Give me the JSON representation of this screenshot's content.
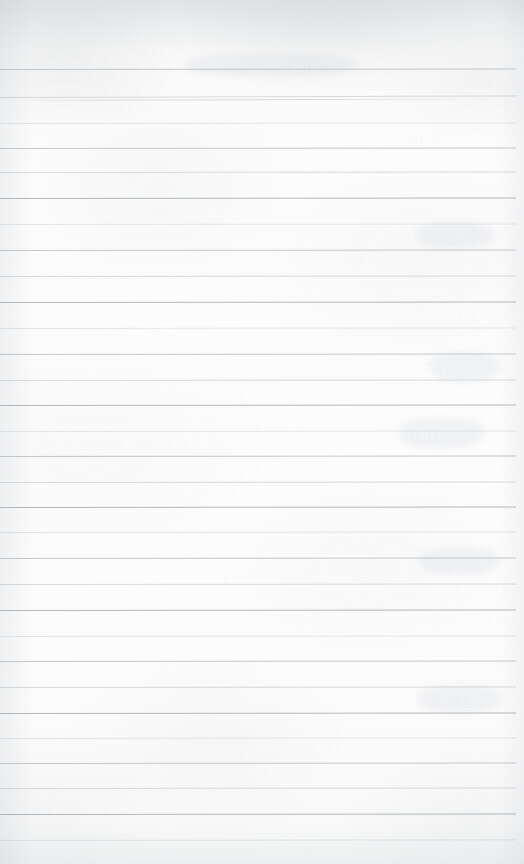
{
  "document": {
    "type": "scanned-lined-paper",
    "title": "",
    "page_width": 524,
    "page_height": 864,
    "content_text": "",
    "is_blank": true,
    "description": "Blank ruled notepad page scan with faint show-through ghost writing"
  },
  "colors": {
    "paper": "#fdfdfd",
    "paper_shadow": "#f2f3f4",
    "rule_line": "#b9bec5",
    "rule_line_soft": "#c8cdd3",
    "rule_line_faint": "#d2d7dc",
    "ghost_ink": "#949ca6"
  },
  "ruling": {
    "top_margin_px": 60,
    "line_spacing_px": 25.7,
    "line_count": 31,
    "left_inset_px": 0,
    "right_inset_px": 8,
    "line_positions": [
      69,
      97,
      100,
      123,
      148,
      172,
      198,
      224,
      250,
      276,
      302,
      328,
      354,
      380,
      405,
      431,
      456,
      482,
      507,
      532,
      558,
      584,
      610,
      636,
      661,
      687,
      713,
      738,
      763,
      788,
      814,
      840
    ]
  },
  "ghost_writing": [
    {
      "text": "nanoparticles of a",
      "x": 190,
      "y": 60,
      "size": "md",
      "rotate": -0.4,
      "opacity": 0.22,
      "flip": false
    },
    {
      "text": "the structure",
      "x": 352,
      "y": 62,
      "size": "sm",
      "rotate": -0.6,
      "opacity": 0.14,
      "flip": true
    },
    {
      "text": "considered in",
      "x": 60,
      "y": 86,
      "size": "sm",
      "rotate": -0.5,
      "opacity": 0.13,
      "flip": true
    },
    {
      "text": "sample",
      "x": 368,
      "y": 108,
      "size": "sm",
      "rotate": -0.3,
      "opacity": 0.13,
      "flip": true
    },
    {
      "text": "of the",
      "x": 404,
      "y": 132,
      "size": "sm",
      "rotate": -0.4,
      "opacity": 0.12,
      "flip": true
    },
    {
      "text": "within",
      "x": 150,
      "y": 152,
      "size": "xs",
      "rotate": -0.4,
      "opacity": 0.1,
      "flip": true
    },
    {
      "text": "3.0",
      "x": 438,
      "y": 232,
      "size": "md",
      "rotate": -0.3,
      "opacity": 0.15,
      "flip": true
    },
    {
      "text": "b.0",
      "x": 452,
      "y": 306,
      "size": "md",
      "rotate": -0.3,
      "opacity": 0.14,
      "flip": true
    },
    {
      "text": "5.0",
      "x": 438,
      "y": 360,
      "size": "lg",
      "rotate": -0.4,
      "opacity": 0.17,
      "flip": true
    },
    {
      "text": "0.9",
      "x": 410,
      "y": 425,
      "size": "lg",
      "rotate": -0.3,
      "opacity": 0.18,
      "flip": true
    },
    {
      "text": "reduced",
      "x": 400,
      "y": 492,
      "size": "sm",
      "rotate": -0.4,
      "opacity": 0.13,
      "flip": true
    },
    {
      "text": "0.60",
      "x": 436,
      "y": 560,
      "size": "md",
      "rotate": -0.3,
      "opacity": 0.14,
      "flip": true
    },
    {
      "text": "sin",
      "x": 452,
      "y": 630,
      "size": "sm",
      "rotate": -0.3,
      "opacity": 0.12,
      "flip": true
    },
    {
      "text": "10.4",
      "x": 432,
      "y": 692,
      "size": "lg",
      "rotate": -0.4,
      "opacity": 0.16,
      "flip": true
    },
    {
      "text": "measured values for each",
      "x": 95,
      "y": 445,
      "size": "xs",
      "rotate": -0.3,
      "opacity": 0.07,
      "flip": true
    },
    {
      "text": "the observed",
      "x": 230,
      "y": 520,
      "size": "xs",
      "rotate": -0.3,
      "opacity": 0.06,
      "flip": true
    },
    {
      "text": "temperature",
      "x": 120,
      "y": 600,
      "size": "xs",
      "rotate": -0.3,
      "opacity": 0.06,
      "flip": true
    },
    {
      "text": "and the",
      "x": 300,
      "y": 742,
      "size": "xs",
      "rotate": -0.3,
      "opacity": 0.06,
      "flip": true
    },
    {
      "text": "results",
      "x": 160,
      "y": 795,
      "size": "xs",
      "rotate": -0.3,
      "opacity": 0.06,
      "flip": true
    }
  ],
  "bleed_blobs": [
    {
      "x": 416,
      "y": 222,
      "w": 78,
      "h": 26
    },
    {
      "x": 430,
      "y": 352,
      "w": 70,
      "h": 30
    },
    {
      "x": 398,
      "y": 418,
      "w": 86,
      "h": 30
    },
    {
      "x": 420,
      "y": 548,
      "w": 80,
      "h": 26
    },
    {
      "x": 418,
      "y": 684,
      "w": 84,
      "h": 28
    },
    {
      "x": 186,
      "y": 54,
      "w": 170,
      "h": 22
    }
  ]
}
